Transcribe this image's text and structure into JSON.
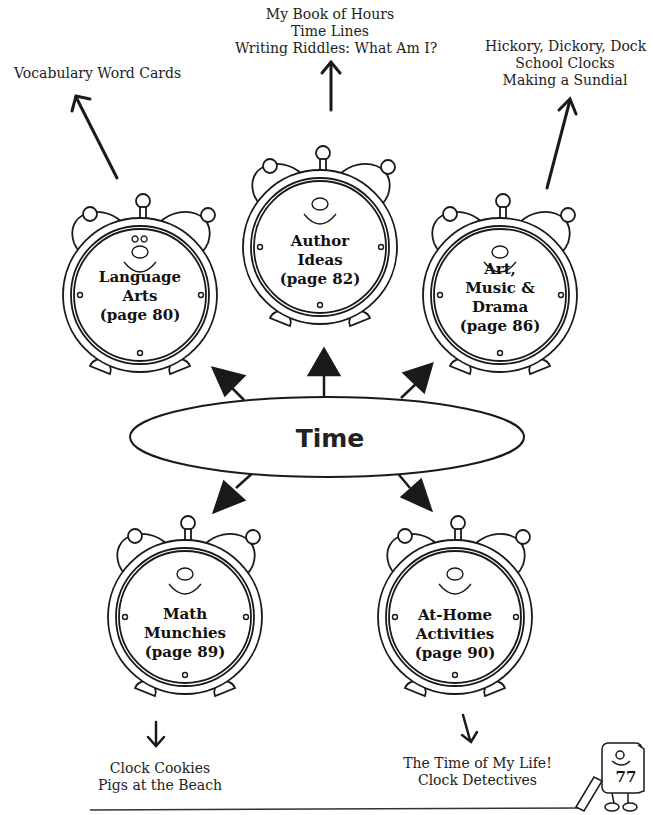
{
  "diagram": {
    "center": {
      "label": "Time"
    },
    "nodes": [
      {
        "id": "language-arts",
        "lines": [
          "Language",
          "Arts",
          "(page 80)"
        ],
        "activities": [
          "Vocabulary Word Cards"
        ]
      },
      {
        "id": "author-ideas",
        "lines": [
          "Author",
          "Ideas",
          "(page 82)"
        ],
        "activities": [
          "My Book of Hours",
          "Time Lines",
          "Writing Riddles: What Am I?"
        ]
      },
      {
        "id": "art-music-drama",
        "lines": [
          "Art,",
          "Music &",
          "Drama",
          "(page 86)"
        ],
        "activities": [
          "Hickory, Dickory, Dock",
          "School Clocks",
          "Making a Sundial"
        ]
      },
      {
        "id": "math-munchies",
        "lines": [
          "Math",
          "Munchies",
          "(page 89)"
        ],
        "activities": [
          "Clock Cookies",
          "Pigs at the Beach"
        ]
      },
      {
        "id": "at-home-activities",
        "lines": [
          "At-Home",
          "Activities",
          "(page 90)"
        ],
        "activities": [
          "The Time of My Life!",
          "Clock Detectives"
        ]
      }
    ]
  },
  "footer": {
    "page_number": "77"
  }
}
